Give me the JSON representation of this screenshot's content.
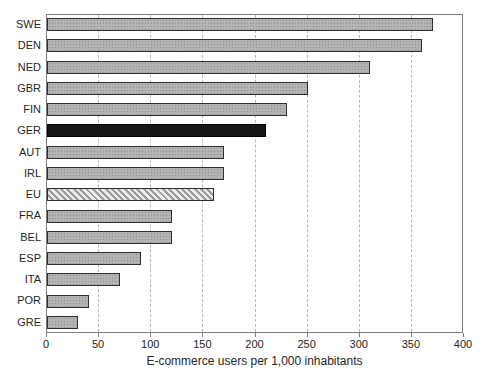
{
  "chart_data": {
    "type": "bar",
    "orientation": "horizontal",
    "title": "",
    "xlabel": "E-commerce users per 1,000 inhabitants",
    "ylabel": "",
    "xlim": [
      0,
      400
    ],
    "x_ticks": [
      0,
      50,
      100,
      150,
      200,
      250,
      300,
      350,
      400
    ],
    "grid": "vertical-dashed",
    "legend": "none",
    "categories": [
      "SWE",
      "DEN",
      "NED",
      "GBR",
      "FIN",
      "GER",
      "AUT",
      "IRL",
      "EU",
      "FRA",
      "BEL",
      "ESP",
      "ITA",
      "POR",
      "GRE"
    ],
    "values": [
      370,
      360,
      310,
      250,
      230,
      210,
      170,
      170,
      160,
      120,
      120,
      90,
      70,
      40,
      30
    ],
    "highlighted_category": "GER",
    "hatched_category": "EU",
    "colors": {
      "bar_fill": "#b3b3b3",
      "bar_texture_dot": "#8f8f8f",
      "bar_border": "#2e2e2e",
      "highlight_fill": "#161616",
      "highlight_border": "#000000",
      "hatch_light": "#ebebeb",
      "hatch_dark": "#9b9b9b",
      "gridline": "#b8b8b8",
      "frame": "#7f7f7f",
      "text": "#262626",
      "background": "#ffffff"
    }
  }
}
